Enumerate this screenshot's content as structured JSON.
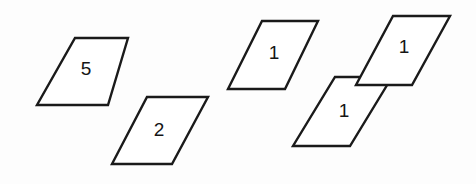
{
  "figure": {
    "background_color": "#fdfdfd",
    "stroke_color": "#1a1a1a",
    "fill_color": "#ffffff",
    "label_color": "#151515",
    "stroke_width": 2.4,
    "width": 476,
    "height": 184,
    "shapes": [
      {
        "id": "parallelogram-5",
        "label": "5",
        "points": "75,38 128,38 108,105 37,105",
        "label_x": 86,
        "label_y": 70
      },
      {
        "id": "parallelogram-2",
        "label": "2",
        "points": "147,97 208,97 172,164 112,164",
        "label_x": 159,
        "label_y": 131
      },
      {
        "id": "parallelogram-1-a",
        "label": "1",
        "points": "262,21 318,21 285,89 228,89",
        "label_x": 274,
        "label_y": 54
      },
      {
        "id": "parallelogram-1-b-upper",
        "label": "1",
        "points": "393,16 450,16 412,85 356,85",
        "label_x": 404,
        "label_y": 48
      },
      {
        "id": "parallelogram-1-c-lower",
        "label": "1",
        "points": "335,77 392,77 350,146 293,146",
        "label_x": 344,
        "label_y": 112
      }
    ]
  }
}
